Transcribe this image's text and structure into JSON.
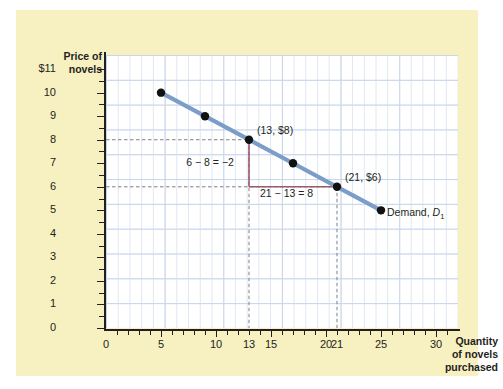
{
  "chart_data": {
    "type": "line",
    "title": "",
    "subtitle": "",
    "xlabel": "Quantity of novels purchased",
    "ylabel": "Price of novels",
    "xlim": [
      0,
      32
    ],
    "ylim": [
      0,
      11.6
    ],
    "grid": true,
    "legend_position": "inline-label",
    "series": [
      {
        "name": "Demand, D1",
        "color": "#7d9dc9",
        "x": [
          5,
          9,
          13,
          17,
          21,
          25
        ],
        "y": [
          10,
          9,
          8,
          7,
          6,
          5
        ],
        "marker": "filled-circle",
        "marker_color": "#111111"
      }
    ],
    "x_tick_labels": [
      "0",
      "5",
      "10",
      "13",
      "15",
      "20",
      "21",
      "25",
      "30"
    ],
    "x_tick_values": [
      0,
      5,
      10,
      13,
      15,
      20,
      21,
      25,
      30
    ],
    "y_tick_labels": [
      "$11",
      "10",
      "9",
      "8",
      "7",
      "6",
      "5",
      "4",
      "3",
      "2",
      "1",
      "0"
    ],
    "y_tick_values": [
      11,
      10,
      9,
      8,
      7,
      6,
      5,
      4,
      3,
      2,
      1,
      0
    ],
    "annotations": [
      {
        "text": "(13, $8)",
        "x": 13,
        "y": 8
      },
      {
        "text": "(21, $6)",
        "x": 21,
        "y": 6
      },
      {
        "text": "6 − 8 = −2",
        "x": 9.2,
        "y": 7.0
      },
      {
        "text": "21 − 13 = 8",
        "x": 17,
        "y": 5.6
      },
      {
        "text": "Demand, D1",
        "x": 25.4,
        "y": 5.0
      }
    ],
    "guide_lines": [
      {
        "type": "horizontal-dashed",
        "y": 8,
        "from_x": 0,
        "to_x": 13
      },
      {
        "type": "horizontal-dashed",
        "y": 6,
        "from_x": 0,
        "to_x": 21
      },
      {
        "type": "vertical-dashed",
        "x": 13,
        "from_y": 0,
        "to_y": 8
      },
      {
        "type": "vertical-dashed",
        "x": 21,
        "from_y": 0,
        "to_y": 6
      }
    ],
    "slope_triangle": {
      "color": "#9e5a6e",
      "rise_label": "6 − 8 = −2",
      "run_label": "21 − 13 = 8",
      "vertex_x": 13,
      "vertex_top_y": 8,
      "vertex_bottom_y": 6,
      "run_to_x": 21
    }
  },
  "axes": {
    "y_title_line1": "Price of",
    "y_title_line2": "novels",
    "x_title_line1": "Quantity",
    "x_title_line2": "of novels",
    "x_title_line3": "purchased",
    "y_ticks": [
      {
        "label": "$11",
        "value": 11
      },
      {
        "label": "10",
        "value": 10
      },
      {
        "label": "9",
        "value": 9
      },
      {
        "label": "8",
        "value": 8
      },
      {
        "label": "7",
        "value": 7
      },
      {
        "label": "6",
        "value": 6
      },
      {
        "label": "5",
        "value": 5
      },
      {
        "label": "4",
        "value": 4
      },
      {
        "label": "3",
        "value": 3
      },
      {
        "label": "2",
        "value": 2
      },
      {
        "label": "1",
        "value": 1
      },
      {
        "label": "0",
        "value": 0
      }
    ],
    "x_ticks": [
      {
        "label": "0",
        "value": 0
      },
      {
        "label": "5",
        "value": 5
      },
      {
        "label": "10",
        "value": 10
      },
      {
        "label": "13",
        "value": 13
      },
      {
        "label": "15",
        "value": 15
      },
      {
        "label": "20",
        "value": 20
      },
      {
        "label": "21",
        "value": 21
      },
      {
        "label": "25",
        "value": 25
      },
      {
        "label": "30",
        "value": 30
      }
    ]
  },
  "labels": {
    "point_13_8": "(13, $8)",
    "point_21_6": "(21, $6)",
    "rise": "6 − 8 = −2",
    "run": "21 − 13 = 8",
    "demand_text": "Demand, ",
    "demand_symbol": "D",
    "demand_subscript": "1"
  },
  "colors": {
    "background": "#f7f0c0",
    "plot_background": "#ffffff",
    "grid_minor": "#dfe7f2",
    "grid_major": "#c9d6ea",
    "demand_line": "#7d9dc9",
    "marker": "#111111",
    "slope_triangle": "#9e5a6e",
    "guide_dash": "#808080",
    "axis": "#231f20",
    "text": "#231f20"
  }
}
